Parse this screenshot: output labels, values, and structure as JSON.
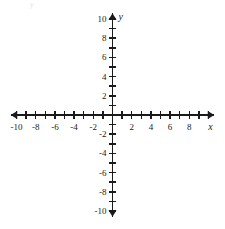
{
  "figure": {
    "kind": "cartesian-coordinate-plane",
    "background_color": "#ffffff",
    "line_color": "#1a1a1a",
    "text_color": "#1a1a1a",
    "faint_artifact_text": "y"
  },
  "chart_data": {
    "type": "scatter",
    "title": "",
    "subtitle": "",
    "xlabel": "x",
    "ylabel": "y",
    "xlim": [
      -10.6,
      10.6
    ],
    "ylim": [
      -10.6,
      10.6
    ],
    "grid": false,
    "legend": null,
    "series": [
      {
        "name": "",
        "x": [],
        "y": []
      }
    ],
    "annotations": [],
    "x_tick_values": [
      -10,
      -9,
      -8,
      -7,
      -6,
      -5,
      -4,
      -3,
      -2,
      -1,
      1,
      2,
      3,
      4,
      5,
      6,
      7,
      8,
      9,
      10
    ],
    "y_tick_values": [
      -10,
      -9,
      -8,
      -7,
      -6,
      -5,
      -4,
      -3,
      -2,
      -1,
      1,
      2,
      3,
      4,
      5,
      6,
      7,
      8,
      9,
      10
    ],
    "x_labeled_ticks": [
      {
        "value": -10,
        "label": "-10"
      },
      {
        "value": -8,
        "label": "-8"
      },
      {
        "value": -6,
        "label": "-6"
      },
      {
        "value": -4,
        "label": "-4"
      },
      {
        "value": -2,
        "label": "-2"
      },
      {
        "value": 2,
        "label": "2"
      },
      {
        "value": 4,
        "label": "4"
      },
      {
        "value": 6,
        "label": "6"
      },
      {
        "value": 8,
        "label": "8"
      }
    ],
    "y_labeled_ticks": [
      {
        "value": 10,
        "label": "10"
      },
      {
        "value": 8,
        "label": "8"
      },
      {
        "value": 6,
        "label": "6"
      },
      {
        "value": 4,
        "label": "4"
      },
      {
        "value": 2,
        "label": "2"
      },
      {
        "value": -2,
        "label": "-2"
      },
      {
        "value": -4,
        "label": "-4"
      },
      {
        "value": -6,
        "label": "-6"
      },
      {
        "value": -8,
        "label": "-8"
      },
      {
        "value": -10,
        "label": "-10"
      }
    ],
    "axis_arrows": [
      "left",
      "right",
      "up",
      "down"
    ],
    "tick_interval": 1,
    "label_interval": 2
  },
  "axis_labels": {
    "x_axis_name": "x",
    "y_axis_name": "y"
  }
}
